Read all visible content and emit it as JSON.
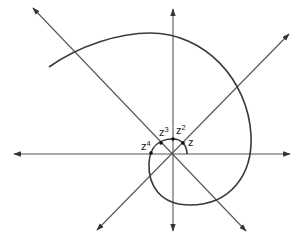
{
  "diagram": {
    "colors": {
      "stroke": "#3a3a3a",
      "axis": "#555555",
      "background": "#ffffff"
    },
    "points": [
      {
        "base": "z",
        "exp": "",
        "x": 183,
        "y": 143
      },
      {
        "base": "z",
        "exp": "2",
        "x": 173,
        "y": 139
      },
      {
        "base": "z",
        "exp": "3",
        "x": 161,
        "y": 143
      },
      {
        "base": "z",
        "exp": "4",
        "x": 151,
        "y": 153
      }
    ],
    "labels": {
      "z1": {
        "base": "z",
        "exp": ""
      },
      "z2": {
        "base": "z",
        "exp": "2"
      },
      "z3": {
        "base": "z",
        "exp": "3"
      },
      "z4": {
        "base": "z",
        "exp": "4"
      }
    }
  }
}
